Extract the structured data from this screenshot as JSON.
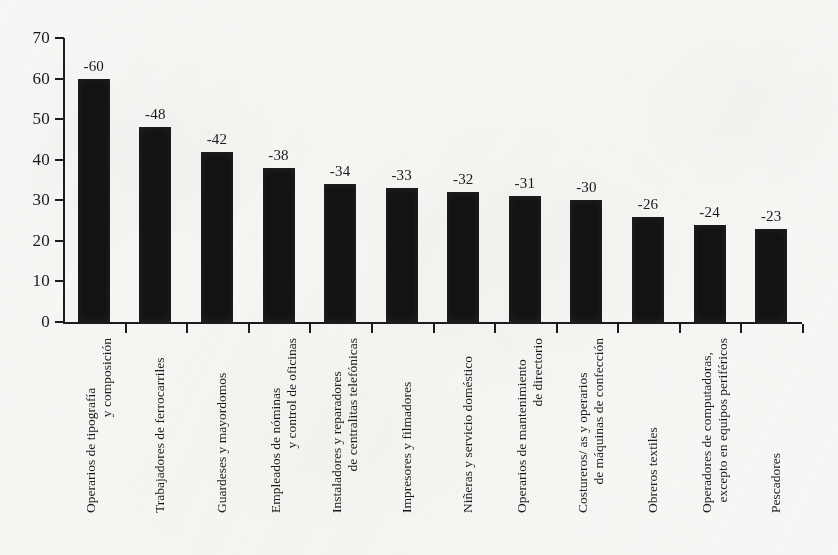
{
  "chart_data": {
    "type": "bar",
    "title": "",
    "subtitle": "",
    "xlabel": "",
    "ylabel": "",
    "ylim": [
      0,
      70
    ],
    "ytick_step": 10,
    "yticks": [
      "0",
      "10",
      "20",
      "30",
      "40",
      "50",
      "60",
      "70"
    ],
    "grid": false,
    "legend": "none",
    "bar_color": "#131313",
    "axis_color": "#1c1c1c",
    "background_color": "#f7f6f4",
    "categories": [
      "Operarios de tipografía y composición",
      "Trabajadores de ferrocarriles",
      "Guardeses y mayordomos",
      "Empleados de nóminas y control de oficinas",
      "Instaladores y reparadores de centralitas telefónicas",
      "Impresores y filmadores",
      "Niñeras y servicio doméstico",
      "Operarios de mantenimiento de directorio",
      "Costureros/ as y operarios de máquinas de confección",
      "Obreros textiles",
      "Operadores de computadoras, excepto en equipos periféricos",
      "Pescadores"
    ],
    "category_lines": [
      [
        "Operarios de tipografía",
        "y composición"
      ],
      [
        "Trabajadores de ferrocarriles"
      ],
      [
        "Guardeses y mayordomos"
      ],
      [
        "Empleados de nóminas",
        "y control de oficinas"
      ],
      [
        "Instaladores y reparadores",
        "de centralitas telefónicas"
      ],
      [
        "Impresores y filmadores"
      ],
      [
        "Niñeras y servicio doméstico"
      ],
      [
        "Operarios de mantenimiento",
        "de directorio"
      ],
      [
        "Costureros/ as y operarios",
        "de máquinas de confección"
      ],
      [
        "Obreros textiles"
      ],
      [
        "Operadores de computadoras,",
        "excepto en equipos periféricos"
      ],
      [
        "Pescadores"
      ]
    ],
    "values": [
      60,
      48,
      42,
      38,
      34,
      33,
      32,
      31,
      30,
      26,
      24,
      23
    ],
    "data_labels": [
      "-60",
      "-48",
      "-42",
      "-38",
      "-34",
      "-33",
      "-32",
      "-31",
      "-30",
      "-26",
      "-24",
      "-23"
    ]
  }
}
